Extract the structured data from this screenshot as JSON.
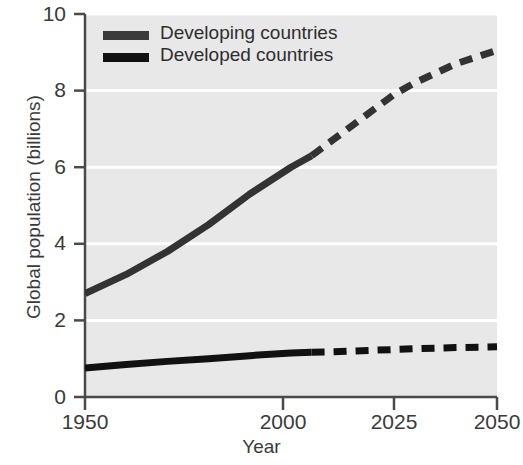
{
  "chart_data": {
    "type": "line",
    "title": "",
    "xlabel": "Year",
    "ylabel": "Global population (billions)",
    "xlim": [
      1950,
      2050
    ],
    "ylim": [
      0,
      10
    ],
    "xticks": [
      "1950",
      "2000",
      "2025",
      "2050"
    ],
    "xtick_values": [
      1950,
      2000,
      2025,
      2050
    ],
    "yticks": [
      "0",
      "2",
      "4",
      "6",
      "8",
      "10"
    ],
    "ytick_values": [
      0,
      2,
      4,
      6,
      8,
      10
    ],
    "grid": "horizontal white gridlines at every y tick",
    "legend_position": "top-left inside plot",
    "plot_background": "#e8e8e8",
    "series": [
      {
        "name": "Developing countries",
        "color": "#333333",
        "linewidth": 7,
        "solid_until": 2005,
        "x": [
          1950,
          1960,
          1970,
          1980,
          1990,
          2000,
          2005,
          2010,
          2020,
          2025,
          2030,
          2040,
          2050
        ],
        "values": [
          2.7,
          3.2,
          3.8,
          4.5,
          5.3,
          6.0,
          6.3,
          6.7,
          7.5,
          7.9,
          8.2,
          8.7,
          9.05
        ]
      },
      {
        "name": "Developed countries",
        "color": "#111111",
        "linewidth": 7,
        "solid_until": 2005,
        "x": [
          1950,
          1960,
          1970,
          1980,
          1990,
          2000,
          2005,
          2010,
          2020,
          2025,
          2030,
          2040,
          2050
        ],
        "values": [
          0.76,
          0.85,
          0.93,
          1.0,
          1.08,
          1.15,
          1.17,
          1.18,
          1.22,
          1.24,
          1.26,
          1.29,
          1.31
        ]
      }
    ]
  },
  "legend": {
    "items": [
      {
        "label": "Developing countries",
        "color": "#3a3a3a"
      },
      {
        "label": "Developed countries",
        "color": "#111111"
      }
    ]
  },
  "axes": {
    "x_title": "Year",
    "y_title": "Global population (billions)",
    "x_tick_labels": [
      "1950",
      "2000",
      "2025",
      "2050"
    ],
    "y_tick_labels": [
      "10",
      "8",
      "6",
      "4",
      "2",
      "0"
    ]
  }
}
